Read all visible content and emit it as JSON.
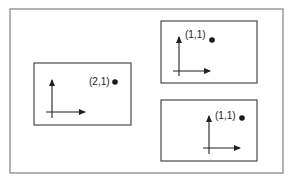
{
  "diagram": {
    "type": "coordinate-frames",
    "colors": {
      "outer_border": "#8a8a8a",
      "panel_border": "#3a3a3a",
      "axis": "#222222",
      "point": "#1a1a1a",
      "background": "#ffffff"
    },
    "outer_frame": {
      "x": 10,
      "y": 9,
      "width": 273,
      "height": 164
    },
    "panels": [
      {
        "id": "left",
        "rect": {
          "x": 34,
          "y": 63,
          "width": 97,
          "height": 62
        },
        "axes": {
          "origin_x": 52,
          "origin_y": 112,
          "y_top": 80,
          "y_bottom": 118,
          "x_left": 46,
          "x_right": 85
        },
        "point": {
          "label": "(2,1)",
          "label_x": 89,
          "label_y": 85,
          "dot_x": 115,
          "dot_y": 82
        }
      },
      {
        "id": "top-right",
        "rect": {
          "x": 161,
          "y": 21,
          "width": 96,
          "height": 62
        },
        "axes": {
          "origin_x": 179,
          "origin_y": 71,
          "y_top": 37,
          "y_bottom": 76,
          "x_left": 173,
          "x_right": 210
        },
        "point": {
          "label": "(1,1)",
          "label_x": 185,
          "label_y": 38,
          "dot_x": 212,
          "dot_y": 40
        }
      },
      {
        "id": "bottom-right",
        "rect": {
          "x": 161,
          "y": 100,
          "width": 96,
          "height": 61
        },
        "axes": {
          "origin_x": 209,
          "origin_y": 148,
          "y_top": 116,
          "y_bottom": 154,
          "x_left": 203,
          "x_right": 240
        },
        "point": {
          "label": "(1,1)",
          "label_x": 215,
          "label_y": 119,
          "dot_x": 242,
          "dot_y": 118
        }
      }
    ]
  }
}
